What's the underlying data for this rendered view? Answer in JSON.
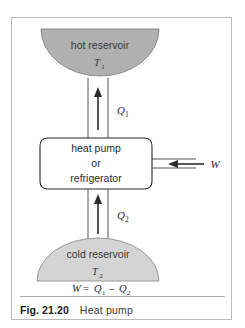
{
  "figure": {
    "caption_label": "Fig. 21.20",
    "caption_text": "Heat pump"
  },
  "diagram": {
    "title": "Heat pump",
    "hot_reservoir": {
      "label": "hot reservoir",
      "temperature": "T",
      "temperature_subscript": "1",
      "fill_color": "#b0b0b0",
      "stroke_color": "#8d8d8d"
    },
    "cold_reservoir": {
      "label": "cold reservoir",
      "temperature": "T",
      "temperature_subscript": "2",
      "fill_color": "#d4d4d4",
      "stroke_color": "#9a9a9a"
    },
    "device_box": {
      "line1": "heat pump",
      "line2": "or",
      "line3": "refrigerator",
      "fill_color": "#ffffff",
      "stroke_color": "#2b2b2b"
    },
    "flows": [
      {
        "name": "heat-out-to-hot",
        "symbol": "Q",
        "subscript": "1",
        "direction": "up"
      },
      {
        "name": "heat-in-from-cold",
        "symbol": "Q",
        "subscript": "2",
        "direction": "up"
      },
      {
        "name": "work-input",
        "symbol": "W",
        "direction": "left"
      }
    ],
    "equation": {
      "lhs": "W",
      "operator_equals": "=",
      "term1": "Q",
      "term1_subscript": "1",
      "operator_minus": "–",
      "term2": "Q",
      "term2_subscript": "2"
    }
  }
}
